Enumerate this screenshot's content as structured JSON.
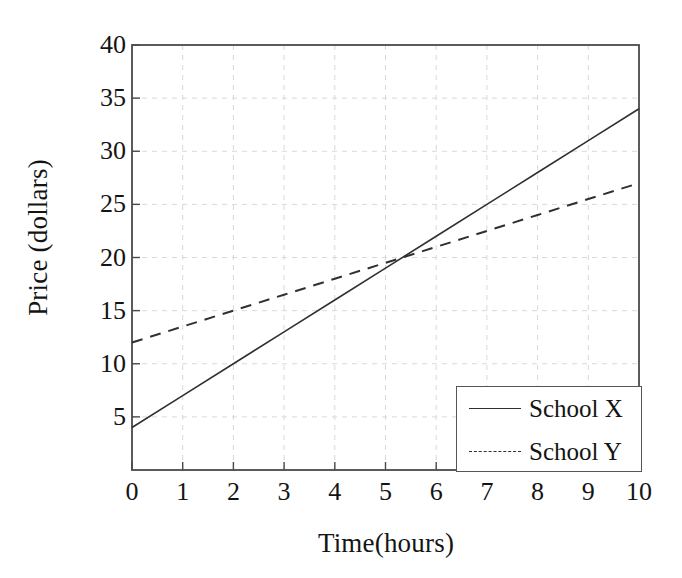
{
  "chart_data": {
    "type": "line",
    "title": "",
    "xlabel": "Time(hours)",
    "ylabel": "Price (dollars)",
    "xlim": [
      0,
      10
    ],
    "ylim": [
      0,
      40
    ],
    "xticks": [
      0,
      1,
      2,
      3,
      4,
      5,
      6,
      7,
      8,
      9,
      10
    ],
    "xtick_labels": [
      "0",
      "1",
      "2",
      "3",
      "4",
      "5",
      "6",
      "7",
      "8",
      "9",
      "10"
    ],
    "yticks": [
      5,
      10,
      15,
      20,
      25,
      30,
      35,
      40
    ],
    "ytick_labels": [
      "5",
      "10",
      "15",
      "20",
      "25",
      "30",
      "35",
      "40"
    ],
    "grid": true,
    "grid_style": "dashed",
    "grid_color": "#d8d8d8",
    "legend_position": "lower-right",
    "x": [
      0,
      1,
      2,
      3,
      4,
      5,
      6,
      7,
      8,
      9,
      10
    ],
    "series": [
      {
        "name": "School X",
        "style": "solid",
        "color": "#303030",
        "values": [
          4,
          7,
          10,
          13,
          16,
          19,
          22,
          25,
          28,
          31,
          34
        ]
      },
      {
        "name": "School Y",
        "style": "dashed",
        "color": "#303030",
        "values": [
          12,
          13.5,
          15,
          16.5,
          18,
          19.5,
          21,
          22.5,
          24,
          25.5,
          27
        ]
      }
    ],
    "annotations": [
      {
        "name": "intersection",
        "x": 5.33,
        "y": 20,
        "label": ""
      }
    ]
  },
  "axes": {
    "border_color": "#4a4a4a"
  },
  "legend": {
    "entries": [
      {
        "label": "School X",
        "style": "solid"
      },
      {
        "label": "School Y",
        "style": "dashed"
      }
    ]
  }
}
